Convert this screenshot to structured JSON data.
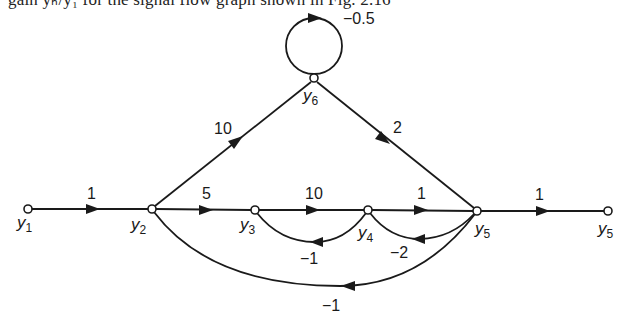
{
  "caption": {
    "text": "gain yₕ/y₁ for the signal flow graph shown in Fig. 2.16"
  },
  "graph": {
    "type": "signal-flow-graph",
    "nodes": [
      {
        "id": "y1",
        "label": "y",
        "sub": "1",
        "x": 28,
        "y": 209
      },
      {
        "id": "y2",
        "label": "y",
        "sub": "2",
        "x": 152,
        "y": 209
      },
      {
        "id": "y3",
        "label": "y",
        "sub": "3",
        "x": 255,
        "y": 210
      },
      {
        "id": "y4",
        "label": "y",
        "sub": "4",
        "x": 368,
        "y": 210
      },
      {
        "id": "y5",
        "label": "y",
        "sub": "5",
        "x": 477,
        "y": 211
      },
      {
        "id": "y5out",
        "label": "y",
        "sub": "5",
        "x": 608,
        "y": 211
      },
      {
        "id": "y6",
        "label": "y",
        "sub": "6",
        "x": 314,
        "y": 79
      }
    ],
    "edges": [
      {
        "id": "e-y1-y2",
        "from": "y1",
        "to": "y2",
        "gain": "1"
      },
      {
        "id": "e-y2-y3",
        "from": "y2",
        "to": "y3",
        "gain": "5"
      },
      {
        "id": "e-y3-y4",
        "from": "y3",
        "to": "y4",
        "gain": "10"
      },
      {
        "id": "e-y4-y5",
        "from": "y4",
        "to": "y5",
        "gain": "1"
      },
      {
        "id": "e-y5-out",
        "from": "y5",
        "to": "y5out",
        "gain": "1"
      },
      {
        "id": "e-y2-y6",
        "from": "y2",
        "to": "y6",
        "gain": "10"
      },
      {
        "id": "e-y6-y5",
        "from": "y6",
        "to": "y5",
        "gain": "2"
      },
      {
        "id": "e-y6-self",
        "from": "y6",
        "to": "y6",
        "gain": "−0.5"
      },
      {
        "id": "e-y4-y3",
        "from": "y4",
        "to": "y3",
        "gain": "−1"
      },
      {
        "id": "e-y5-y4",
        "from": "y5",
        "to": "y4",
        "gain": "−2"
      },
      {
        "id": "e-y5-y2",
        "from": "y5",
        "to": "y2",
        "gain": "−1"
      }
    ]
  },
  "labels": {
    "g_y1_y2": "1",
    "g_y2_y3": "5",
    "g_y3_y4": "10",
    "g_y4_y5": "1",
    "g_y5_out": "1",
    "g_y2_y6": "10",
    "g_y6_y5": "2",
    "g_y6_self": "−0.5",
    "g_y4_y3": "−1",
    "g_y5_y4": "−2",
    "g_y5_y2": "−1",
    "n_y": "y",
    "s1": "1",
    "s2": "2",
    "s3": "3",
    "s4": "4",
    "s5": "5",
    "s6": "6"
  }
}
